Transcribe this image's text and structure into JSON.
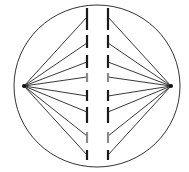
{
  "diagram": {
    "canvas": {
      "width": 189,
      "height": 172,
      "background": "#ffffff"
    },
    "cell_membrane": {
      "cx": 97,
      "cy": 86,
      "rx": 83,
      "ry": 81,
      "stroke": "#333333",
      "stroke_width": 1
    },
    "poles": [
      {
        "id": "left-pole",
        "x": 24,
        "y": 86
      },
      {
        "id": "right-pole",
        "x": 171,
        "y": 86
      }
    ],
    "chromatid_columns": {
      "left_x": 87,
      "right_x": 108
    },
    "chromatids": [
      {
        "top": 8,
        "bottom": 30,
        "attach_y": 17,
        "color": "#1a1a1a"
      },
      {
        "top": 35,
        "bottom": 48,
        "attach_y": 43,
        "color": "#1a1a1a"
      },
      {
        "top": 55,
        "bottom": 68,
        "attach_y": 62,
        "color": "#1a1a1a"
      },
      {
        "top": 73,
        "bottom": 82,
        "attach_y": 77,
        "color": "#8a8a8a"
      },
      {
        "top": 90,
        "bottom": 101,
        "attach_y": 96,
        "color": "#1a1a1a"
      },
      {
        "top": 107,
        "bottom": 123,
        "attach_y": 112,
        "color": "#1a1a1a"
      },
      {
        "top": 132,
        "bottom": 143,
        "attach_y": 136,
        "color": "#8a8a8a"
      },
      {
        "top": 150,
        "bottom": 160,
        "attach_y": 155,
        "color": "#1a1a1a"
      }
    ],
    "spindle_fiber_color": "#222222",
    "chromatid_width": 2.2
  }
}
